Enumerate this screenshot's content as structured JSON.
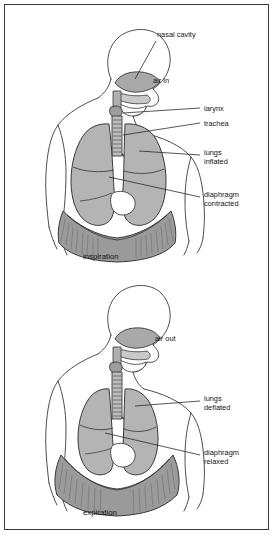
{
  "figure": {
    "colors": {
      "outline": "#3a3a3a",
      "organ_fill": "#b4b4b4",
      "airway_fill": "#a9a9a9",
      "diaphragm_fill": "#9a9a9a",
      "background": "#ffffff",
      "text": "#141414"
    }
  },
  "panels": [
    {
      "id": "inspiration",
      "caption": "inspiration",
      "labels": [
        {
          "id": "nasal-cavity",
          "text": "nasal cavity",
          "lines": [
            "nasal cavity"
          ]
        },
        {
          "id": "air-in",
          "text": "air in",
          "lines": [
            "air in"
          ]
        },
        {
          "id": "larynx",
          "text": "larynx",
          "lines": [
            "larynx"
          ]
        },
        {
          "id": "trachea",
          "text": "trachea",
          "lines": [
            "trachea"
          ]
        },
        {
          "id": "lungs",
          "text": "lungs inflated",
          "lines": [
            "lungs",
            "inflated"
          ]
        },
        {
          "id": "diaphragm",
          "text": "diaphragm contracted",
          "lines": [
            "diaphragm",
            "contracted"
          ]
        }
      ]
    },
    {
      "id": "expiration",
      "caption": "expiration",
      "labels": [
        {
          "id": "air-out",
          "text": "air out",
          "lines": [
            "air out"
          ]
        },
        {
          "id": "lungs",
          "text": "lungs deflated",
          "lines": [
            "lungs",
            "deflated"
          ]
        },
        {
          "id": "diaphragm",
          "text": "diaphragm relaxed",
          "lines": [
            "diaphragm",
            "relaxed"
          ]
        }
      ]
    }
  ]
}
